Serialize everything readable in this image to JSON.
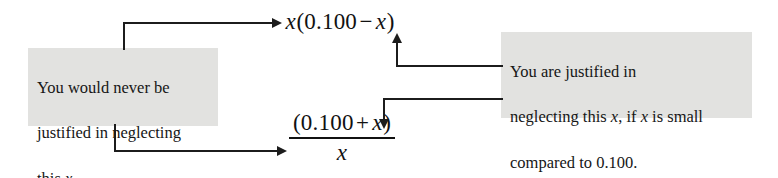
{
  "figure": {
    "kind": "annotated-equation-diagram",
    "background_color": "#ffffff",
    "callout_background_color": "#e2e2e0",
    "line_color": "#1c1c1c"
  },
  "expressions": {
    "top": {
      "label": "top-expression",
      "parts": {
        "lead_var": "x",
        "open_paren": "(",
        "constant": "0.100",
        "operator": "−",
        "term_var": "x",
        "close_paren": ")"
      },
      "plain_text": "x(0.100 − x)"
    },
    "bottom": {
      "label": "bottom-fraction",
      "numerator": {
        "open_paren": "(",
        "constant": "0.100",
        "operator": "+",
        "term_var": "x",
        "close_paren": ")"
      },
      "denominator_var": "x",
      "plain_text": "(0.100 + x) / x"
    }
  },
  "callouts": {
    "left": {
      "name": "callout-never-justified",
      "line1": "You would never be",
      "line2_a": "justified in neglecting",
      "line3_a": "this ",
      "line3_var": "x",
      "line3_b": ".",
      "plain_text": "You would never be justified in neglecting this x."
    },
    "right": {
      "name": "callout-justified",
      "line1": "You are justified in",
      "line2_a": "neglecting this ",
      "line2_var1": "x",
      "line2_b": ", if ",
      "line2_var2": "x",
      "line2_c": " is small",
      "line3": "compared to 0.100.",
      "plain_text": "You are justified in neglecting this x, if x is small compared to 0.100."
    }
  },
  "connectors": [
    {
      "name": "connector-left-to-top-expression",
      "from": "callout-never-justified",
      "to": "top-expression-lead-x",
      "arrowhead": "right"
    },
    {
      "name": "connector-left-to-denominator",
      "from": "callout-never-justified",
      "to": "bottom-fraction-denominator-x",
      "arrowhead": "right"
    },
    {
      "name": "connector-right-to-top-expression",
      "from": "callout-justified",
      "to": "top-expression-term-x",
      "arrowhead": "up"
    },
    {
      "name": "connector-right-to-numerator",
      "from": "callout-justified",
      "to": "bottom-fraction-numerator-x",
      "arrowhead": "down"
    }
  ]
}
